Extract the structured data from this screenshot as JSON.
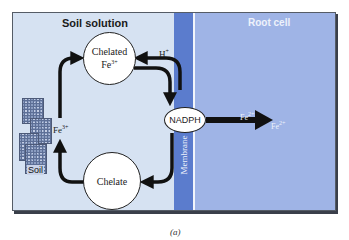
{
  "diagram": {
    "regions": {
      "soil_solution": "Soil solution",
      "root_cell": "Root cell",
      "membrane": "Membrane"
    },
    "nodes": {
      "chelated_fe3": {
        "line1": "Chelated",
        "line2": "Fe",
        "sup": "3+"
      },
      "chelate": "Chelate",
      "nadph": "NADPH",
      "soil": "Soil"
    },
    "labels": {
      "h_plus": {
        "base": "H",
        "sup": "+"
      },
      "fe3_plus": {
        "base": "Fe",
        "sup": "3+"
      },
      "fe2_plus_a": {
        "base": "Fe",
        "sup": "2+"
      },
      "fe2_plus_b": {
        "base": "Fe",
        "sup": "2+"
      }
    },
    "caption": "(a)",
    "colors": {
      "soil_solution_bg": "#d6e2f2",
      "membrane_bg": "#5b7ccd",
      "root_cell_bg": "#9fb4e6",
      "arrow": "#111111"
    }
  }
}
